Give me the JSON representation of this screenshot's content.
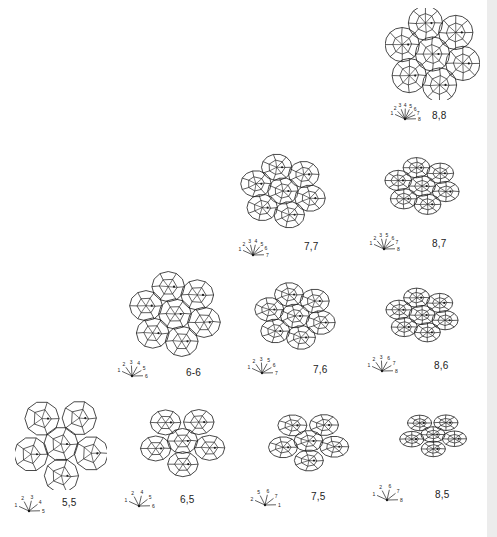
{
  "figure": {
    "ink_color": "#1a1a1a",
    "background": "#ffffff",
    "edge_strip_color": "#ececec",
    "panels": [
      {
        "id": "p88",
        "label": "8,8",
        "n": 8,
        "m": 8,
        "fan_labels": [
          "1",
          "2",
          "3",
          "4",
          "5",
          "6",
          "7",
          "8"
        ],
        "x": 385,
        "y": 8,
        "w": 95,
        "h": 92,
        "fan_x": 390,
        "fan_y": 98,
        "label_x": 432,
        "label_y": 110
      },
      {
        "id": "p77",
        "label": "7,7",
        "n": 7,
        "m": 7,
        "fan_labels": [
          "1",
          "2",
          "3",
          "4",
          "5",
          "6",
          "7"
        ],
        "x": 233,
        "y": 150,
        "w": 100,
        "h": 82,
        "fan_x": 238,
        "fan_y": 234,
        "label_x": 304,
        "label_y": 241
      },
      {
        "id": "p87",
        "label": "8,7",
        "n": 8,
        "m": 7,
        "fan_labels": [
          "1",
          "2",
          "3",
          "5",
          "6",
          "7",
          "8"
        ],
        "x": 372,
        "y": 150,
        "w": 100,
        "h": 72,
        "fan_x": 369,
        "fan_y": 228,
        "label_x": 432,
        "label_y": 238
      },
      {
        "id": "p66",
        "label": "6-6",
        "n": 6,
        "m": 6,
        "fan_labels": [
          "1",
          "2",
          "3",
          "4",
          "5",
          "6"
        ],
        "x": 125,
        "y": 270,
        "w": 100,
        "h": 88,
        "fan_x": 117,
        "fan_y": 355,
        "label_x": 186,
        "label_y": 367
      },
      {
        "id": "p76",
        "label": "7,6",
        "n": 7,
        "m": 6,
        "fan_labels": [
          "1",
          "2",
          "3",
          "5",
          "6",
          "7"
        ],
        "x": 245,
        "y": 277,
        "w": 100,
        "h": 78,
        "fan_x": 247,
        "fan_y": 352,
        "label_x": 313,
        "label_y": 364
      },
      {
        "id": "p86",
        "label": "8,6",
        "n": 8,
        "m": 6,
        "fan_labels": [
          "1",
          "2",
          "3",
          "6",
          "7",
          "8"
        ],
        "x": 372,
        "y": 280,
        "w": 100,
        "h": 70,
        "fan_x": 367,
        "fan_y": 350,
        "label_x": 434,
        "label_y": 360
      },
      {
        "id": "p55",
        "label": "5,5",
        "n": 5,
        "m": 5,
        "fan_labels": [
          "1",
          "2",
          "3",
          "4",
          "5"
        ],
        "x": 15,
        "y": 398,
        "w": 92,
        "h": 92,
        "fan_x": 14,
        "fan_y": 490,
        "label_x": 62,
        "label_y": 497
      },
      {
        "id": "p65",
        "label": "6,5",
        "n": 6,
        "m": 5,
        "fan_labels": [
          "1",
          "2",
          "4",
          "5",
          "6"
        ],
        "x": 130,
        "y": 400,
        "w": 105,
        "h": 82,
        "fan_x": 124,
        "fan_y": 485,
        "label_x": 180,
        "label_y": 494
      },
      {
        "id": "p75",
        "label": "7,5",
        "n": 7,
        "m": 5,
        "fan_labels": [
          "2",
          "5",
          "6",
          "7",
          "1"
        ],
        "x": 252,
        "y": 402,
        "w": 113,
        "h": 78,
        "fan_x": 250,
        "fan_y": 484,
        "label_x": 311,
        "label_y": 491
      },
      {
        "id": "p85",
        "label": "8,5",
        "n": 8,
        "m": 5,
        "fan_labels": [
          "1",
          "2",
          "6",
          "7",
          "8"
        ],
        "x": 380,
        "y": 402,
        "w": 106,
        "h": 65,
        "fan_x": 372,
        "fan_y": 479,
        "label_x": 435,
        "label_y": 489
      }
    ]
  }
}
